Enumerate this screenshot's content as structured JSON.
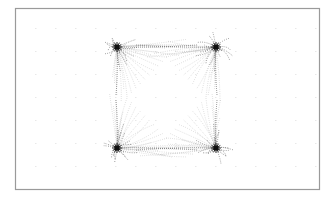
{
  "figure": {
    "type": "vector-field-streamlines",
    "frame": {
      "x": 15,
      "y": 8,
      "width": 304,
      "height": 181,
      "stroke": "#9a9a9a"
    },
    "colors": {
      "ink": "#111111",
      "faint": "#cfcfcf",
      "dots": "#d9d9d9"
    },
    "hubs": [
      {
        "id": "top-left",
        "cx": 117,
        "cy": 47,
        "qx": -1,
        "qy": -1
      },
      {
        "id": "top-right",
        "cx": 216,
        "cy": 47,
        "qx": 1,
        "qy": -1
      },
      {
        "id": "bottom-left",
        "cx": 117,
        "cy": 148,
        "qx": -1,
        "qy": 1
      },
      {
        "id": "bottom-right",
        "cx": 216,
        "cy": 148,
        "qx": 1,
        "qy": 1
      }
    ],
    "grid": {
      "x0": 35,
      "y0": 28,
      "dx": 20,
      "dy": 23,
      "cols": 15,
      "rows": 7
    }
  }
}
